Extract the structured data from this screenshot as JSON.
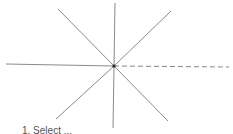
{
  "diagram": {
    "center": {
      "x": 114,
      "y": 66
    },
    "line_color": "#8a8a8a",
    "center_color": "#222222",
    "rays": [
      {
        "name": "ray-up",
        "x2": 115,
        "y2": 3,
        "dashed": false
      },
      {
        "name": "ray-down",
        "x2": 113,
        "y2": 128,
        "dashed": false
      },
      {
        "name": "ray-left",
        "x2": 6,
        "y2": 64,
        "dashed": false
      },
      {
        "name": "ray-right",
        "x2": 229,
        "y2": 67,
        "dashed": true
      },
      {
        "name": "ray-upper-left",
        "x2": 58,
        "y2": 9,
        "dashed": false
      },
      {
        "name": "ray-upper-right",
        "x2": 171,
        "y2": 11,
        "dashed": false
      },
      {
        "name": "ray-lower-left",
        "x2": 56,
        "y2": 119,
        "dashed": false
      },
      {
        "name": "ray-lower-right",
        "x2": 168,
        "y2": 121,
        "dashed": false
      }
    ]
  },
  "caption": "1.  Select ..."
}
